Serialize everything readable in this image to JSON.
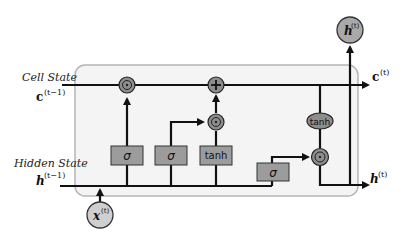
{
  "colors": {
    "cell_box_fill": "#f4f4f4",
    "cell_box_stroke": "#b5b5b5",
    "gate_fill": "#9c9c9c",
    "op_fill": "#8d8d8d",
    "io_fill": "#cfcfcf",
    "wire": "#111111"
  },
  "labels": {
    "cell_state": "Cell State",
    "hidden_state": "Hidden State",
    "c_prev": "c",
    "c_prev_sup": "(t−1)",
    "h_prev": "h",
    "h_prev_sup": "(t−1)",
    "c_out": "c",
    "c_out_sup": "(t)",
    "h_out": "h",
    "h_out_sup": "(t)",
    "h_top": "h",
    "h_top_sup": "(t)",
    "x_in": "x",
    "x_in_sup": "(t)"
  },
  "gates": [
    {
      "id": "forget",
      "label": "σ"
    },
    {
      "id": "input",
      "label": "σ"
    },
    {
      "id": "candidate",
      "label": "tanh"
    },
    {
      "id": "output",
      "label": "σ"
    }
  ],
  "ops": {
    "forget_mul": "⊙",
    "add": "+",
    "input_mul": "⊙",
    "cell_tanh": "tanh",
    "output_mul": "⊙"
  }
}
